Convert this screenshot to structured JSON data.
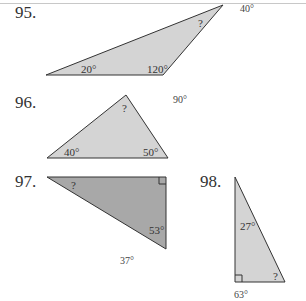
{
  "problems": [
    {
      "number": "95.",
      "angles": [
        "20°",
        "120°",
        "?"
      ],
      "annotation": "40°",
      "fill": "#d4d4d4"
    },
    {
      "number": "96.",
      "angles": [
        "?",
        "40°",
        "50°"
      ],
      "annotation": "90°",
      "fill": "#d4d4d4"
    },
    {
      "number": "97.",
      "angles": [
        "?",
        "53°"
      ],
      "right_angle": true,
      "annotation": "37°",
      "fill": "#a8a8a8"
    },
    {
      "number": "98.",
      "angles": [
        "27°",
        "?"
      ],
      "right_angle": true,
      "annotation": "63°",
      "fill": "#d4d4d4"
    }
  ]
}
